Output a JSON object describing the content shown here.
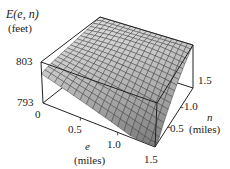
{
  "chart_data": {
    "type": "surface",
    "title": "",
    "zlabel": "E(e, n)",
    "zunits": "(feet)",
    "xlabel": "e",
    "xunits": "(miles)",
    "ylabel": "n",
    "yunits": "(miles)",
    "x_ticks": [
      "0",
      "0.5",
      "1.0",
      "1.5"
    ],
    "y_ticks": [
      "0.5",
      "1.0",
      "1.5"
    ],
    "z_ticks": [
      "793",
      "803"
    ],
    "xlim": [
      0,
      1.5
    ],
    "ylim": [
      0,
      1.5
    ],
    "zlim": [
      793,
      803
    ],
    "grid": true,
    "surface_color": "#c8c8c8",
    "mesh_color": "#333333"
  },
  "labels": {
    "z_title": "E(e, n)",
    "z_units": "(feet)",
    "z_top": "803",
    "z_bottom": "793",
    "e_0": "0",
    "e_05": "0.5",
    "e_10": "1.0",
    "e_15": "1.5",
    "e_title": "e",
    "e_units": "(miles)",
    "n_05": "0.5",
    "n_10": "1.0",
    "n_15": "1.5",
    "n_title": "n",
    "n_units": "(miles)"
  }
}
